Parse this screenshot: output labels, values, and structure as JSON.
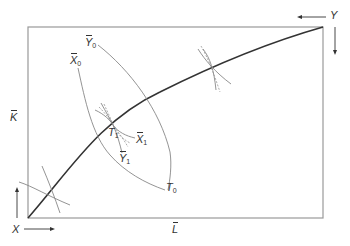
{
  "diagram": {
    "type": "Edgeworth box",
    "colors": {
      "box": "#999999",
      "curve": "#333333",
      "isoquant": "#8a8a8a",
      "text": "#333333"
    },
    "origins": {
      "X": {
        "label": "X",
        "position": "bottom-left",
        "arrows": [
          "right",
          "up"
        ]
      },
      "Y": {
        "label": "Y",
        "position": "top-right",
        "arrows": [
          "left",
          "down"
        ]
      }
    },
    "axes": {
      "left": {
        "label": "K",
        "bar": true
      },
      "bottom": {
        "label": "L",
        "bar": true
      }
    },
    "labels": {
      "y0": {
        "base": "Y",
        "sub": "0",
        "bar": true
      },
      "x0": {
        "base": "X",
        "sub": "0",
        "bar": true
      },
      "t1": {
        "base": "T",
        "sub": "1",
        "bar": false
      },
      "x1": {
        "base": "X",
        "sub": "1",
        "bar": true
      },
      "y1": {
        "base": "Y",
        "sub": "1",
        "bar": true
      },
      "t0": {
        "base": "T",
        "sub": "0",
        "bar": false
      }
    }
  }
}
